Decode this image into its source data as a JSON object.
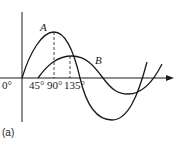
{
  "diagram": {
    "curves": [
      {
        "name": "A",
        "start_deg": 0,
        "peak_deg": 90,
        "amplitude": "larger"
      },
      {
        "name": "B",
        "start_deg": 45,
        "peak_deg": 135,
        "amplitude": "smaller"
      }
    ],
    "x_tick_labels": [
      "0°",
      "45°",
      "90°",
      "135°"
    ],
    "curve_labels": {
      "a": "A",
      "b": "B"
    },
    "caption": "(a)",
    "colors": {
      "line": "#1a1a1a",
      "background": "#ffffff"
    }
  }
}
